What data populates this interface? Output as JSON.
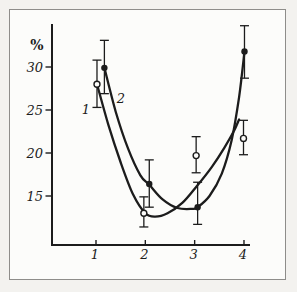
{
  "figure": {
    "ink": "#1c1c1c",
    "paper": "#fcfcfa",
    "page_background": "#f3f2ef",
    "frame_border": "#8e8d8a"
  },
  "chart_data": {
    "type": "line",
    "title": "",
    "xlabel": "",
    "ylabel": "%",
    "x_ticks": [
      1,
      2,
      3,
      4
    ],
    "y_ticks": [
      30,
      25,
      20,
      15
    ],
    "xlim": [
      0.1,
      4.15
    ],
    "ylim": [
      9,
      35
    ],
    "grid": false,
    "legend_position": "none",
    "marker_legend": {
      "open-circle": "series 1",
      "filled-circle": "series 2"
    },
    "series": [
      {
        "name": "1",
        "marker": "open-circle",
        "points": [
          {
            "x": 1.02,
            "y": 28.0,
            "lo": 25.3,
            "hi": 30.8
          },
          {
            "x": 1.97,
            "y": 13.0,
            "lo": 11.4,
            "hi": 14.9
          },
          {
            "x": 3.03,
            "y": 19.7,
            "lo": 17.7,
            "hi": 21.9
          },
          {
            "x": 3.99,
            "y": 21.7,
            "lo": 19.8,
            "hi": 23.8
          }
        ],
        "curve": [
          [
            1.02,
            28.0
          ],
          [
            1.25,
            23.3
          ],
          [
            1.5,
            18.9
          ],
          [
            1.75,
            15.2
          ],
          [
            2.0,
            13.0
          ],
          [
            2.2,
            12.6
          ],
          [
            2.45,
            13.0
          ],
          [
            2.75,
            14.2
          ],
          [
            3.05,
            16.2
          ],
          [
            3.35,
            18.4
          ],
          [
            3.6,
            20.6
          ],
          [
            3.8,
            22.6
          ],
          [
            3.9,
            23.9
          ]
        ]
      },
      {
        "name": "2",
        "marker": "filled-circle",
        "points": [
          {
            "x": 1.17,
            "y": 29.9,
            "lo": 26.9,
            "hi": 33.1
          },
          {
            "x": 2.08,
            "y": 16.4,
            "lo": 13.7,
            "hi": 19.2
          },
          {
            "x": 3.06,
            "y": 13.7,
            "lo": 11.7,
            "hi": 16.6
          },
          {
            "x": 4.01,
            "y": 31.8,
            "lo": 28.7,
            "hi": 34.8
          }
        ],
        "curve": [
          [
            1.17,
            29.9
          ],
          [
            1.4,
            24.8
          ],
          [
            1.65,
            20.5
          ],
          [
            1.9,
            17.4
          ],
          [
            2.08,
            16.3
          ],
          [
            2.35,
            14.6
          ],
          [
            2.65,
            13.6
          ],
          [
            2.95,
            13.5
          ],
          [
            3.06,
            13.7
          ],
          [
            3.3,
            15.0
          ],
          [
            3.55,
            17.6
          ],
          [
            3.75,
            21.5
          ],
          [
            3.9,
            26.5
          ],
          [
            4.01,
            31.8
          ]
        ]
      }
    ],
    "annotations": [
      {
        "text": "1",
        "px": [
          86,
          114
        ]
      },
      {
        "text": "2",
        "px": [
          121,
          103
        ]
      }
    ]
  }
}
